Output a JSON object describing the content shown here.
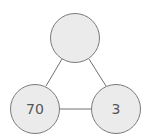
{
  "diagram": {
    "type": "triangle-graph",
    "nodes": [
      {
        "id": "top",
        "label": "",
        "cx": 75,
        "cy": 38,
        "r": 25
      },
      {
        "id": "bottom-left",
        "label": "70",
        "cx": 35,
        "cy": 109,
        "r": 25
      },
      {
        "id": "bottom-right",
        "label": "3",
        "cx": 116,
        "cy": 109,
        "r": 25
      }
    ],
    "edges": [
      {
        "from": "top",
        "to": "bottom-left"
      },
      {
        "from": "top",
        "to": "bottom-right"
      },
      {
        "from": "bottom-left",
        "to": "bottom-right"
      }
    ],
    "colors": {
      "node_fill": "#ebebeb",
      "node_stroke": "#7a7a7a",
      "edge": "#707070",
      "text": "#555555"
    }
  }
}
